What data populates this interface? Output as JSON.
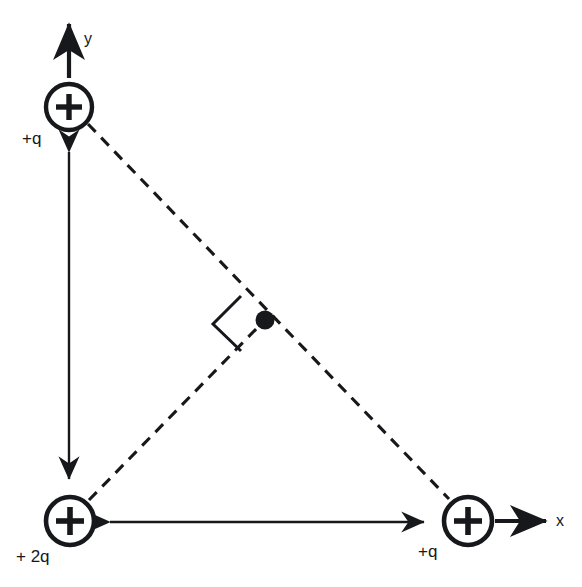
{
  "figure": {
    "background_color": "#ffffff",
    "stroke_color": "#16181b",
    "canvas": {
      "width": 582,
      "height": 587
    }
  },
  "axes": {
    "y": {
      "label": "y",
      "label_x": 84,
      "label_y": 44,
      "arrow_from_x": 69,
      "arrow_from_y": 78,
      "arrow_to_x": 69,
      "arrow_to_y": 24
    },
    "x": {
      "label": "x",
      "label_x": 556,
      "label_y": 526,
      "arrow_from_x": 495,
      "arrow_from_y": 521,
      "arrow_to_x": 546,
      "arrow_to_y": 521
    }
  },
  "charges": [
    {
      "id": "charge-top-left",
      "label": "+q",
      "symbol": "+",
      "cx": 69,
      "cy": 107,
      "r": 23,
      "label_x": 22,
      "label_y": 144
    },
    {
      "id": "charge-bottom-left",
      "label": "+ 2q",
      "symbol": "+",
      "cx": 70,
      "cy": 521,
      "r": 24,
      "label_x": 16,
      "label_y": 562
    },
    {
      "id": "charge-bottom-right",
      "label": "+q",
      "symbol": "+",
      "cx": 468,
      "cy": 521,
      "r": 24,
      "label_x": 418,
      "label_y": 557
    }
  ],
  "field_point": {
    "id": "field-point-dot",
    "cx": 265,
    "cy": 320,
    "r": 9
  },
  "dashed_lines": [
    {
      "id": "hypotenuse",
      "x1": 88,
      "y1": 124,
      "x2": 449,
      "y2": 499
    },
    {
      "id": "perpendicular",
      "x1": 89,
      "y1": 500,
      "x2": 262,
      "y2": 323
    }
  ],
  "right_angle_marker": {
    "id": "right-angle-marker",
    "points": "241,296 213,324 241,351 268,323"
  },
  "dimension_arrows": [
    {
      "id": "vertical-dimension-arrow",
      "orientation": "vertical",
      "x1": 69,
      "y1": 150,
      "x2": 69,
      "y2": 481
    },
    {
      "id": "horizontal-dimension-arrow",
      "orientation": "horizontal",
      "x1": 108,
      "y1": 522,
      "x2": 426,
      "y2": 522
    }
  ]
}
